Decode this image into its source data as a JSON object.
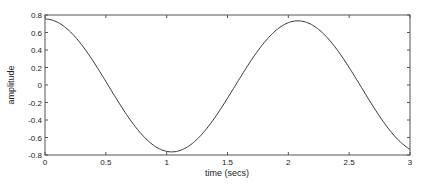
{
  "chart_data": {
    "type": "line",
    "title": "",
    "xlabel": "time (secs)",
    "ylabel": "amplitude",
    "xlim": [
      0,
      3
    ],
    "ylim": [
      -0.8,
      0.8
    ],
    "xticks": [
      0,
      0.5,
      1,
      1.5,
      2,
      2.5,
      3
    ],
    "xtick_labels": [
      "0",
      "0.5",
      "1",
      "1.5",
      "2",
      "2.5",
      "3"
    ],
    "yticks": [
      -0.8,
      -0.6,
      -0.4,
      -0.2,
      0,
      0.2,
      0.4,
      0.6,
      0.8
    ],
    "ytick_labels": [
      "-0.8",
      "-0.6",
      "-0.4",
      "-0.2",
      "0",
      "0.2",
      "0.4",
      "0.6",
      "0.8"
    ],
    "grid": false,
    "legend": null,
    "series": [
      {
        "name": "signal",
        "color": "#333333",
        "x": [
          0,
          0.1,
          0.2,
          0.3,
          0.4,
          0.5,
          0.6,
          0.7,
          0.8,
          0.9,
          1.0,
          1.05,
          1.1,
          1.2,
          1.3,
          1.4,
          1.5,
          1.6,
          1.7,
          1.8,
          1.9,
          2.0,
          2.07,
          2.1,
          2.2,
          2.3,
          2.4,
          2.5,
          2.6,
          2.7,
          2.8,
          2.9,
          3.0
        ],
        "values": [
          0.754,
          0.72,
          0.62,
          0.47,
          0.28,
          0.07,
          -0.15,
          -0.35,
          -0.53,
          -0.66,
          -0.74,
          -0.754,
          -0.75,
          -0.7,
          -0.6,
          -0.45,
          -0.26,
          -0.06,
          0.15,
          0.35,
          0.52,
          0.65,
          0.72,
          0.72,
          0.68,
          0.58,
          0.43,
          0.24,
          0.04,
          -0.17,
          -0.38,
          -0.57,
          -0.72
        ]
      }
    ]
  }
}
